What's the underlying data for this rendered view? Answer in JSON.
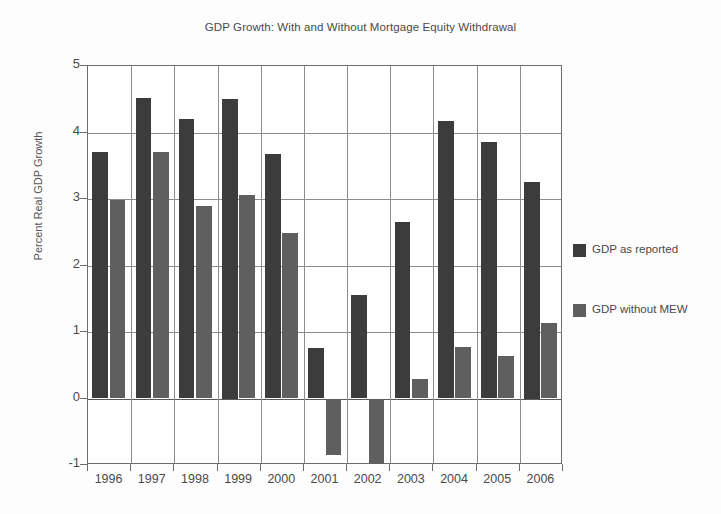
{
  "chart_data": {
    "type": "bar",
    "title": "GDP Growth: With and Without Mortgage Equity Withdrawal",
    "xlabel": "",
    "ylabel": "Percent Real GDP Growth",
    "categories": [
      "1996",
      "1997",
      "1998",
      "1999",
      "2000",
      "2001",
      "2002",
      "2003",
      "2004",
      "2005",
      "2006"
    ],
    "series": [
      {
        "name": "GDP as reported",
        "color": "#3c3c3c",
        "values": [
          3.7,
          4.52,
          4.2,
          4.5,
          3.68,
          0.76,
          1.56,
          2.66,
          4.17,
          3.85,
          3.25
        ]
      },
      {
        "name": "GDP without MEW",
        "color": "#5f5f5f",
        "values": [
          2.99,
          3.7,
          2.89,
          3.06,
          2.49,
          -0.85,
          -0.98,
          0.3,
          0.77,
          0.64,
          1.14
        ]
      }
    ],
    "ylim": [
      -1,
      5
    ],
    "yticks": [
      5,
      4,
      3,
      2,
      1,
      0,
      -1
    ],
    "ytick_labels": [
      "5",
      "4",
      "3",
      "2",
      "1",
      "0",
      "-1"
    ],
    "grid": "both",
    "legend_position": "right"
  },
  "legend": {
    "entries": [
      {
        "label": "GDP as reported",
        "color": "#3c3c3c"
      },
      {
        "label": "GDP without MEW",
        "color": "#5f5f5f"
      }
    ]
  }
}
